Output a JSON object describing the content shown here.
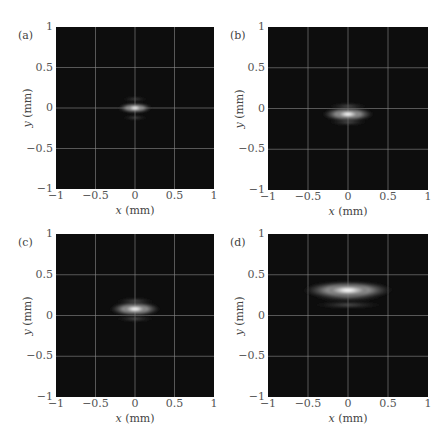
{
  "figure": {
    "panels": [
      {
        "id": "a",
        "label": "(a)"
      },
      {
        "id": "b",
        "label": "(b)"
      },
      {
        "id": "c",
        "label": "(c)"
      },
      {
        "id": "d",
        "label": "(d)"
      }
    ],
    "x_axis_var": "x",
    "x_axis_unit": "(mm)",
    "y_axis_var": "y",
    "y_axis_unit": "(mm)",
    "x_ticks": [
      "−1",
      "−0.5",
      "0",
      "0.5",
      "1"
    ],
    "y_ticks": [
      "1",
      "0.5",
      "0",
      "−0.5",
      "−1"
    ],
    "colors": {
      "background": "#0d0d0d",
      "grid": "#8a8a8a",
      "beam_peak": "#ffffff"
    }
  },
  "chart_data": [
    {
      "type": "heatmap",
      "panel": "(a)",
      "title": "",
      "xlabel": "x (mm)",
      "ylabel": "y (mm)",
      "xlim": [
        -1,
        1
      ],
      "ylim": [
        -1,
        1
      ],
      "x_ticks": [
        -1,
        -0.5,
        0,
        0.5,
        1
      ],
      "y_ticks": [
        -1,
        -0.5,
        0,
        0.5,
        1
      ],
      "grid": true,
      "description": "Grayscale beam intensity profile; small elliptical spot",
      "spot": {
        "center_x": 0.0,
        "center_y": 0.0,
        "half_width_x": 0.22,
        "half_width_y": 0.05,
        "side_lobes_y": [
          0.11,
          -0.12
        ]
      }
    },
    {
      "type": "heatmap",
      "panel": "(b)",
      "title": "",
      "xlabel": "x (mm)",
      "ylabel": "y (mm)",
      "xlim": [
        -1,
        1
      ],
      "ylim": [
        -1,
        1
      ],
      "x_ticks": [
        -1,
        -0.5,
        0,
        0.5,
        1
      ],
      "y_ticks": [
        -1,
        -0.5,
        0,
        0.5,
        1
      ],
      "grid": true,
      "description": "Grayscale beam intensity profile; elongated spot shifted slightly down",
      "spot": {
        "center_x": 0.0,
        "center_y": -0.07,
        "half_width_x": 0.33,
        "half_width_y": 0.07,
        "side_lobes_y": [
          0.03,
          -0.17
        ]
      }
    },
    {
      "type": "heatmap",
      "panel": "(c)",
      "title": "",
      "xlabel": "x (mm)",
      "ylabel": "y (mm)",
      "xlim": [
        -1,
        1
      ],
      "ylim": [
        -1,
        1
      ],
      "x_ticks": [
        -1,
        -0.5,
        0,
        0.5,
        1
      ],
      "y_ticks": [
        -1,
        -0.5,
        0,
        0.5,
        1
      ],
      "grid": true,
      "description": "Grayscale beam intensity profile; elongated spot shifted slightly up",
      "spot": {
        "center_x": 0.0,
        "center_y": 0.08,
        "half_width_x": 0.33,
        "half_width_y": 0.07,
        "side_lobes_y": [
          0.18,
          -0.04
        ]
      }
    },
    {
      "type": "heatmap",
      "panel": "(d)",
      "title": "",
      "xlabel": "x (mm)",
      "ylabel": "y (mm)",
      "xlim": [
        -1,
        1
      ],
      "ylim": [
        -1,
        1
      ],
      "x_ticks": [
        -1,
        -0.5,
        0,
        0.5,
        1
      ],
      "y_ticks": [
        -1,
        -0.5,
        0,
        0.5,
        1
      ],
      "grid": true,
      "description": "Grayscale beam intensity profile; broad elongated spot shifted up to y≈0.3",
      "spot": {
        "center_x": 0.0,
        "center_y": 0.31,
        "half_width_x": 0.58,
        "half_width_y": 0.09,
        "side_lobes_y": [
          0.22,
          0.13
        ]
      }
    }
  ]
}
